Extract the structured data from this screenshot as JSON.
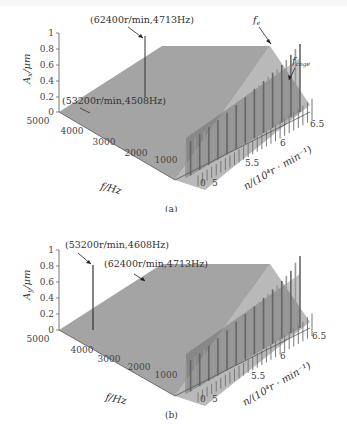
{
  "chart_data": [
    {
      "type": "waterfall-3d",
      "panel": "(a)",
      "zlabel": "Ax/μm",
      "xlabel": "f/Hz",
      "ylabel": "n/(10^4 r·min^-1)",
      "z_ticks": [
        "0",
        "0.2",
        "0.4",
        "0.6",
        "0.8",
        "1"
      ],
      "x_ticks": [
        "5000",
        "4000",
        "3000",
        "2000",
        "1000",
        "0"
      ],
      "y_ticks": [
        "5",
        "5.5",
        "6",
        "6.5"
      ],
      "zlim": [
        0,
        1
      ],
      "xlim": [
        0,
        5000
      ],
      "ylim": [
        5,
        6.5
      ],
      "annotations": [
        {
          "text": "(62400r/min,4713Hz)",
          "speed_rpm": 62400,
          "freq_hz": 4713,
          "amplitude": 0.85
        },
        {
          "text": "(53200r/min,4508Hz)",
          "speed_rpm": 53200,
          "freq_hz": 4508,
          "amplitude": 0.1
        },
        {
          "text": "fe",
          "label": "rotation frequency harmonic series"
        },
        {
          "text": "fcoge",
          "label": "cogging frequency series"
        }
      ],
      "series_low_freq_peaks": {
        "speeds_x1e4": [
          5.0,
          5.06,
          5.12,
          5.18,
          5.24,
          5.3,
          5.36,
          5.42,
          5.48,
          5.54,
          5.6,
          5.66,
          5.72,
          5.78,
          5.84,
          5.9,
          5.96,
          6.02,
          6.08,
          6.14,
          6.2,
          6.26,
          6.32,
          6.38,
          6.44,
          6.5
        ],
        "amplitude_um": [
          0.42,
          0.43,
          0.44,
          0.45,
          0.46,
          0.47,
          0.48,
          0.49,
          0.5,
          0.52,
          0.54,
          0.55,
          0.56,
          0.58,
          0.6,
          0.62,
          0.63,
          0.65,
          0.67,
          0.69,
          0.7,
          0.72,
          0.75,
          0.78,
          0.82,
          0.85
        ]
      }
    },
    {
      "type": "waterfall-3d",
      "panel": "(b)",
      "zlabel": "Ay/μm",
      "xlabel": "f/Hz",
      "ylabel": "n/(10^4 r·min^-1)",
      "z_ticks": [
        "0",
        "0.2",
        "0.4",
        "0.6",
        "0.8",
        "1"
      ],
      "x_ticks": [
        "5000",
        "4000",
        "3000",
        "2000",
        "1000",
        "0"
      ],
      "y_ticks": [
        "5",
        "5.5",
        "6",
        "6.5"
      ],
      "zlim": [
        0,
        1
      ],
      "xlim": [
        0,
        5000
      ],
      "ylim": [
        5,
        6.5
      ],
      "annotations": [
        {
          "text": "(53200r/min,4608Hz)",
          "speed_rpm": 53200,
          "freq_hz": 4608,
          "amplitude": 0.63
        },
        {
          "text": "(62400r/min,4713Hz)",
          "speed_rpm": 62400,
          "freq_hz": 4713,
          "amplitude": 0.12
        }
      ],
      "series_low_freq_peaks": {
        "speeds_x1e4": [
          5.0,
          5.06,
          5.12,
          5.18,
          5.24,
          5.3,
          5.36,
          5.42,
          5.48,
          5.54,
          5.6,
          5.66,
          5.72,
          5.78,
          5.84,
          5.9,
          5.96,
          6.02,
          6.08,
          6.14,
          6.2,
          6.26,
          6.32,
          6.38,
          6.44,
          6.5
        ],
        "amplitude_um": [
          0.38,
          0.39,
          0.4,
          0.41,
          0.42,
          0.44,
          0.45,
          0.47,
          0.48,
          0.5,
          0.52,
          0.54,
          0.55,
          0.57,
          0.58,
          0.6,
          0.62,
          0.64,
          0.66,
          0.68,
          0.7,
          0.72,
          0.75,
          0.78,
          0.85,
          0.9
        ]
      }
    }
  ],
  "panels": {
    "a": {
      "caption": "(a)",
      "zlabel_main": "A",
      "zlabel_sub": "x",
      "zlabel_unit": "/μm",
      "xlabel": "f/Hz",
      "ylabel": "n/(10⁴r · min⁻¹)",
      "ann1": "(62400r/min,4713Hz)",
      "ann2": "(53200r/min,4508Hz)",
      "fe": "f",
      "fe_sub": "e",
      "fcoge": "f",
      "fcoge_sub": "coge"
    },
    "b": {
      "caption": "(b)",
      "zlabel_main": "A",
      "zlabel_sub": "y",
      "zlabel_unit": "/μm",
      "xlabel": "f/Hz",
      "ylabel": "n/(10⁴r · min⁻¹)",
      "ann1": "(53200r/min,4608Hz)",
      "ann2": "(62400r/min,4713Hz)"
    },
    "ticks": {
      "z": [
        "0",
        "0.2",
        "0.4",
        "0.6",
        "0.8",
        "1"
      ],
      "x": [
        "5000",
        "4000",
        "3000",
        "2000",
        "1000"
      ],
      "x0": "0",
      "y": [
        "5",
        "5.5",
        "6",
        "6.5"
      ]
    }
  }
}
